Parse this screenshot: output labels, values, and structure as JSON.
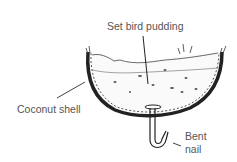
{
  "diagram": {
    "labels": {
      "pudding": "Set bird pudding",
      "shell": "Coconut shell",
      "nail_line1": "Bent",
      "nail_line2": "nail"
    }
  }
}
